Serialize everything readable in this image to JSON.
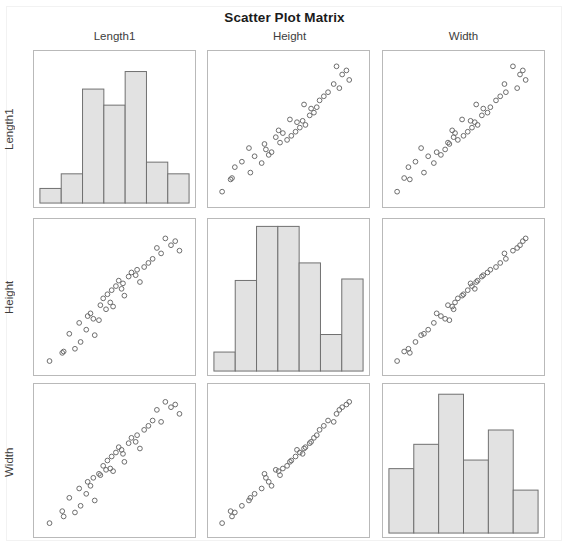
{
  "title": "Scatter Plot Matrix",
  "variables": [
    "Length1",
    "Height",
    "Width"
  ],
  "col_headers": [
    "Length1",
    "Height",
    "Width"
  ],
  "row_headers": [
    "Length1",
    "Height",
    "Width"
  ],
  "style": {
    "bar_fill": "#e2e2e2",
    "bar_stroke": "#6f6f6f",
    "point_stroke": "#6b6b6b",
    "panel_border": "#b9b9b9",
    "title_color": "#1b1b1b",
    "label_color": "#3d3d3d",
    "background": "#ffffff"
  },
  "chart_data": {
    "type": "scatter",
    "title": "Scatter Plot Matrix",
    "xlabel": "",
    "ylabel": "",
    "grid": false,
    "legend": "none",
    "matrix_size": 3,
    "variables": [
      "Length1",
      "Height",
      "Width"
    ],
    "marker": "open-circle",
    "xlim": [
      0,
      1
    ],
    "ylim": [
      0,
      1
    ],
    "diagonal": "histogram",
    "histograms": [
      {
        "variable": "Length1",
        "type": "bar",
        "bins": 7,
        "categories": [
          "b1",
          "b2",
          "b3",
          "b4",
          "b5",
          "b6",
          "b7"
        ],
        "values": [
          0.1,
          0.2,
          0.78,
          0.67,
          0.9,
          0.28,
          0.2
        ],
        "ylim": [
          0,
          1
        ]
      },
      {
        "variable": "Height",
        "type": "bar",
        "bins": 7,
        "categories": [
          "b1",
          "b2",
          "b3",
          "b4",
          "b5",
          "b6",
          "b7"
        ],
        "values": [
          0.13,
          0.62,
          0.99,
          0.99,
          0.74,
          0.25,
          0.63
        ],
        "ylim": [
          0,
          1
        ]
      },
      {
        "variable": "Width",
        "type": "bar",
        "bins": 6,
        "categories": [
          "b1",
          "b2",
          "b3",
          "b4",
          "b5",
          "b6"
        ],
        "values": [
          0.45,
          0.62,
          0.97,
          0.51,
          0.72,
          0.3
        ],
        "ylim": [
          0,
          1
        ]
      }
    ],
    "points": {
      "Length1": [
        0.04,
        0.13,
        0.14,
        0.18,
        0.22,
        0.25,
        0.26,
        0.3,
        0.31,
        0.33,
        0.35,
        0.36,
        0.39,
        0.4,
        0.42,
        0.44,
        0.45,
        0.47,
        0.48,
        0.49,
        0.51,
        0.53,
        0.55,
        0.56,
        0.57,
        0.6,
        0.62,
        0.65,
        0.66,
        0.68,
        0.71,
        0.74,
        0.77,
        0.8,
        0.83,
        0.86,
        0.9,
        0.93,
        0.96
      ],
      "Height": [
        0.03,
        0.09,
        0.1,
        0.23,
        0.12,
        0.31,
        0.17,
        0.26,
        0.36,
        0.38,
        0.34,
        0.22,
        0.33,
        0.44,
        0.49,
        0.41,
        0.52,
        0.46,
        0.55,
        0.43,
        0.58,
        0.62,
        0.56,
        0.6,
        0.51,
        0.65,
        0.68,
        0.66,
        0.7,
        0.61,
        0.72,
        0.75,
        0.78,
        0.86,
        0.82,
        0.93,
        0.88,
        0.91,
        0.84
      ],
      "Width": [
        0.03,
        0.12,
        0.08,
        0.22,
        0.11,
        0.29,
        0.16,
        0.25,
        0.34,
        0.31,
        0.37,
        0.2,
        0.4,
        0.39,
        0.46,
        0.43,
        0.5,
        0.44,
        0.53,
        0.42,
        0.56,
        0.6,
        0.58,
        0.55,
        0.49,
        0.63,
        0.67,
        0.64,
        0.69,
        0.59,
        0.73,
        0.76,
        0.8,
        0.88,
        0.79,
        0.94,
        0.9,
        0.92,
        0.85
      ]
    }
  }
}
